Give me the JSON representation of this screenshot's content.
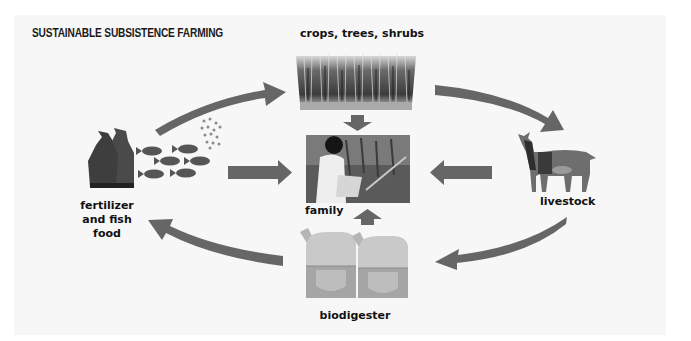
{
  "diagram": {
    "title": "SUSTAINABLE SUBSISTENCE FARMING",
    "type": "cycle",
    "colors": {
      "background": "#ffffff",
      "panel": "#f7f7f7",
      "arrow": "#666666",
      "text": "#111111"
    },
    "nodes": [
      {
        "id": "crops",
        "label": "crops, trees, shrubs",
        "image": "crop-field-image"
      },
      {
        "id": "livestock",
        "label": "livestock",
        "image": "goat-image"
      },
      {
        "id": "biodigester",
        "label": "biodigester",
        "image": "biodigester-tanks-image"
      },
      {
        "id": "fertilizer",
        "label_lines": [
          "fertilizer",
          "and fish",
          "food"
        ],
        "image": "fertilizer-bags-and-fish-image"
      },
      {
        "id": "family",
        "label": "family",
        "image": "family-photo-image"
      }
    ],
    "edges": [
      {
        "from": "fertilizer",
        "to": "crops",
        "shape": "curved"
      },
      {
        "from": "crops",
        "to": "livestock",
        "shape": "curved"
      },
      {
        "from": "livestock",
        "to": "biodigester",
        "shape": "curved"
      },
      {
        "from": "biodigester",
        "to": "fertilizer",
        "shape": "curved"
      },
      {
        "from": "crops",
        "to": "family",
        "shape": "straight"
      },
      {
        "from": "fertilizer",
        "to": "family",
        "shape": "straight"
      },
      {
        "from": "livestock",
        "to": "family",
        "shape": "straight"
      },
      {
        "from": "biodigester",
        "to": "family",
        "shape": "straight"
      }
    ]
  }
}
